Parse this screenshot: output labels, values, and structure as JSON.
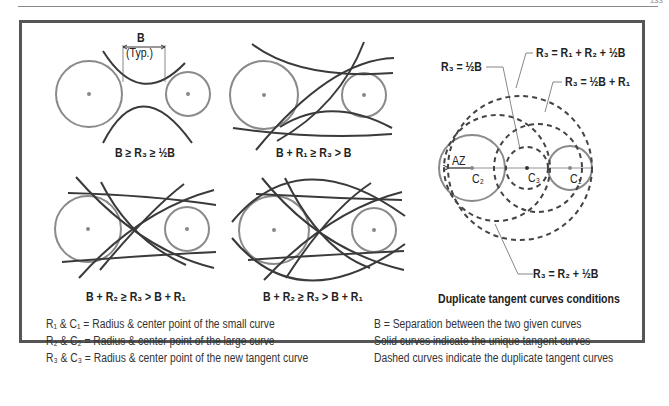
{
  "page": {
    "page_number": "133"
  },
  "diagrams": [
    {
      "id": "case-1",
      "dimension_label": "B",
      "dimension_note": "(Typ.)",
      "condition": "B ≥ R₃ ≥ ½B"
    },
    {
      "id": "case-2",
      "condition": "B + R₁ ≥ R₃ > B"
    },
    {
      "id": "case-3",
      "condition": "B + R₂ ≥ R₃ > B + R₁"
    },
    {
      "id": "case-4",
      "condition": "B + R₂ ≥ R₃ > B + R₁"
    }
  ],
  "duplicate_diagram": {
    "title": "Duplicate tangent curves conditions",
    "callouts": {
      "half_b": "R₃ = ½B",
      "r1_r2_half_b": "R₃ = R₁ + R₂ + ½B",
      "half_b_r1": "R₃ = ½B + R₁",
      "r2_half_b": "R₃ = R₂ + ½B"
    },
    "points": {
      "az": "AZ",
      "c1": "C₁",
      "c2": "C₂",
      "c3": "C₃"
    }
  },
  "legend_left": [
    "R₁ & C₁ = Radius & center point of the small curve",
    "R₂ & C₂ = Radius & center point of the large curve",
    "R₃ & C₃ = Radius & center point of the new tangent curve"
  ],
  "legend_right": [
    "B   = Separation  between the two given curves",
    "Solid curves indicate the unique tangent curves",
    "Dashed curves indicate the duplicate tangent curves"
  ],
  "colors": {
    "given_circle": "#8a8a8a",
    "tangent_curve": "#3a3a3a",
    "dashed_curve": "#444444",
    "panel_border": "#555555",
    "center_dot": "#888888"
  }
}
